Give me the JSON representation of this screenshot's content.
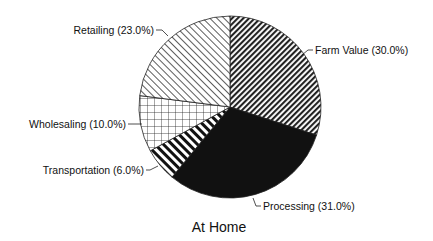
{
  "chart_data": {
    "type": "pie",
    "title": "At Home",
    "start_angle_deg": 0,
    "direction": "clockwise",
    "slices": [
      {
        "label": "Farm Value",
        "value": 30.0,
        "display": "Farm Value (30.0%)",
        "fill": "dense-diagonal-hatch-down"
      },
      {
        "label": "Processing",
        "value": 31.0,
        "display": "Processing (31.0%)",
        "fill": "solid-black"
      },
      {
        "label": "Transportation",
        "value": 6.0,
        "display": "Transportation (6.0%)",
        "fill": "thick-diagonal-stripes"
      },
      {
        "label": "Wholesaling",
        "value": 10.0,
        "display": "Wholesaling (10.0%)",
        "fill": "grid-crosshatch"
      },
      {
        "label": "Retailing",
        "value": 23.0,
        "display": "Retailing (23.0%)",
        "fill": "light-diagonal-hatch-up"
      }
    ],
    "categories": [
      "Farm Value",
      "Processing",
      "Transportation",
      "Wholesaling",
      "Retailing"
    ],
    "values": [
      30.0,
      31.0,
      6.0,
      10.0,
      23.0
    ],
    "unit": "%",
    "legend": "none (leader-line labels)"
  },
  "labels": {
    "farm_value": "Farm Value (30.0%)",
    "processing": "Processing (31.0%)",
    "transportation": "Transportation (6.0%)",
    "wholesaling": "Wholesaling (10.0%)",
    "retailing": "Retailing (23.0%)",
    "title": "At Home"
  },
  "colors": {
    "ink": "#111111",
    "background": "#ffffff"
  }
}
